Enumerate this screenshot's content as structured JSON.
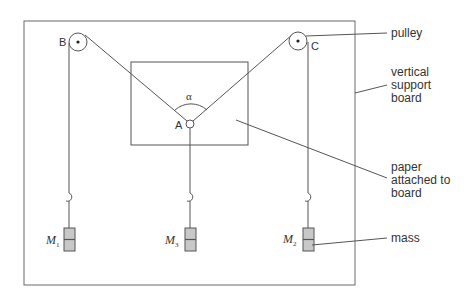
{
  "diagram": {
    "colors": {
      "line": "#555555",
      "mass_fill": "#c8c8c8",
      "text": "#333333"
    },
    "points": {
      "B": "B",
      "C": "C",
      "A": "A"
    },
    "angle_label": "α",
    "masses": [
      {
        "id": "M1",
        "symbol": "M",
        "subscript": "1"
      },
      {
        "id": "M3",
        "symbol": "M",
        "subscript": "3"
      },
      {
        "id": "M2",
        "symbol": "M",
        "subscript": "2"
      }
    ],
    "callouts": {
      "pulley": "pulley",
      "board": [
        "vertical",
        "support",
        "board"
      ],
      "paper": [
        "paper",
        "attached to",
        "board"
      ],
      "mass": "mass"
    }
  }
}
